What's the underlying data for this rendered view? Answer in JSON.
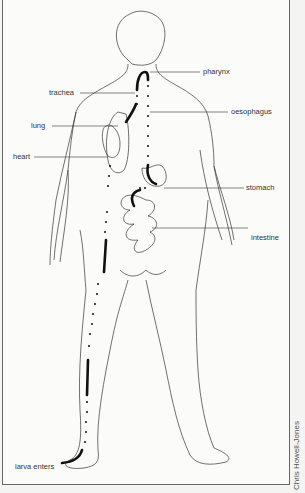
{
  "diagram": {
    "labels": {
      "pharynx": "pharynx",
      "trachea": "trachea",
      "oesophagus": "oesophagus",
      "lung": "lung",
      "heart": "heart",
      "stomach": "stomach",
      "intestine": "intestine",
      "larva_enters": "larva enters"
    },
    "credit": "Chris Howell-Jones",
    "colors": {
      "line": "#222222",
      "background": "#fbfbfa",
      "text": "#333333"
    }
  }
}
